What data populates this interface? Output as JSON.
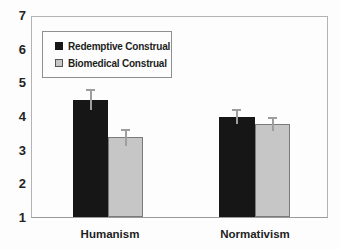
{
  "chart_data": {
    "type": "bar",
    "title": "",
    "categories": [
      "Humanism",
      "Normativism"
    ],
    "series": [
      {
        "name": "Redemptive Construal",
        "color": "#161616",
        "values": [
          4.5,
          4.0
        ],
        "errors": [
          0.3,
          0.2
        ]
      },
      {
        "name": "Biomedical Construal",
        "color": "#c6c6c6",
        "border_color": "#7a7a7a",
        "values": [
          3.4,
          3.8
        ],
        "errors": [
          0.25,
          0.2
        ]
      }
    ],
    "ylim": [
      1,
      7
    ],
    "yticks": [
      7,
      6,
      5,
      4,
      3,
      2,
      1
    ],
    "xlabel": "",
    "ylabel": "",
    "grid": false,
    "legend_position": "top-left",
    "errorbar_color": "#9e9e9e",
    "errorbar_style": "cap-on-top"
  }
}
